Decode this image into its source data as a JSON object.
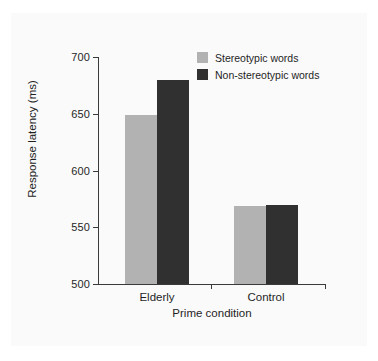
{
  "figure": {
    "background_color": "#fafafa",
    "page_color": "#ffffff"
  },
  "chart_data": {
    "type": "bar",
    "title": "",
    "subtitle": "",
    "xlabel": "Prime condition",
    "ylabel": "Response latency (ms)",
    "categories": [
      "Elderly",
      "Control"
    ],
    "series": [
      {
        "name": "Stereotypic words",
        "color": "#b2b2b2",
        "values": [
          649,
          569
        ]
      },
      {
        "name": "Non-stereotypic words",
        "color": "#303030",
        "values": [
          680,
          570
        ]
      }
    ],
    "ylim": [
      500,
      700
    ],
    "yticks": [
      500,
      550,
      600,
      650,
      700
    ],
    "ytick_labels": [
      "500",
      "550",
      "600",
      "650",
      "700"
    ],
    "xtick_labels": [
      "Elderly",
      "Control"
    ],
    "grid": false,
    "legend_position": "top-right",
    "legend_entries": [
      "Stereotypic words",
      "Non-stereotypic words"
    ],
    "annotations": []
  }
}
